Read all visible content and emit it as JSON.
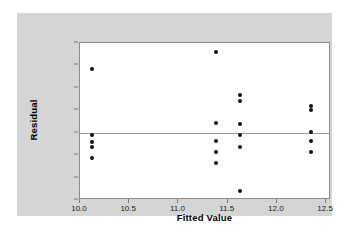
{
  "chart_data": {
    "type": "scatter",
    "title": "",
    "xlabel": "Fitted Value",
    "ylabel": "Residual",
    "xlim": [
      10.0,
      12.55
    ],
    "ylim": [
      -3,
      4
    ],
    "xticks": [
      "10.0",
      "10.5",
      "11.0",
      "11.5",
      "12.0",
      "12.5"
    ],
    "xtick_values": [
      10.0,
      10.5,
      11.0,
      11.5,
      12.0,
      12.5
    ],
    "yticks": [
      "4",
      "3",
      "2",
      "1",
      "0",
      "-1",
      "-2",
      "-3"
    ],
    "ytick_values": [
      4,
      3,
      2,
      1,
      0,
      -1,
      -2,
      -3
    ],
    "grid": false,
    "legend": null,
    "reference_line_y": 0,
    "marker_color": "#111111",
    "points": [
      {
        "x": 10.12,
        "y": 2.85
      },
      {
        "x": 10.12,
        "y": -0.12
      },
      {
        "x": 10.12,
        "y": -0.4
      },
      {
        "x": 10.12,
        "y": -0.62
      },
      {
        "x": 10.12,
        "y": -1.12
      },
      {
        "x": 11.38,
        "y": 3.62
      },
      {
        "x": 11.38,
        "y": 0.45
      },
      {
        "x": 11.38,
        "y": -0.38
      },
      {
        "x": 11.38,
        "y": -0.88
      },
      {
        "x": 11.38,
        "y": -1.35
      },
      {
        "x": 11.63,
        "y": 1.68
      },
      {
        "x": 11.63,
        "y": 1.4
      },
      {
        "x": 11.63,
        "y": 0.4
      },
      {
        "x": 11.63,
        "y": -0.12
      },
      {
        "x": 11.63,
        "y": -0.62
      },
      {
        "x": 11.63,
        "y": -2.62
      },
      {
        "x": 12.35,
        "y": 1.18
      },
      {
        "x": 12.35,
        "y": 1.02
      },
      {
        "x": 12.35,
        "y": 0.02
      },
      {
        "x": 12.35,
        "y": -0.35
      },
      {
        "x": 12.35,
        "y": -0.85
      }
    ]
  },
  "figure": {
    "panel_background": "#d5d5d5",
    "plot_background": "#ffffff",
    "frame_color": "#8a8a8a",
    "page_background": "#ffffff"
  }
}
